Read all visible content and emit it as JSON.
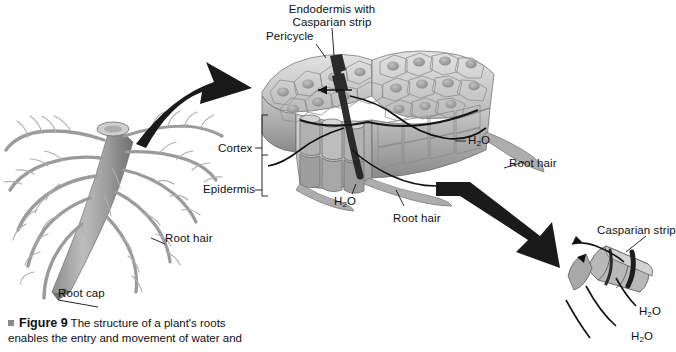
{
  "figure": {
    "number_label": "Figure 9",
    "caption_text": " The structure of a plant's roots enables the entry and movement of water and"
  },
  "labels": {
    "endodermis": "Endodermis with\nCasparian strip",
    "endodermis_line1": "Endodermis with",
    "endodermis_line2": "Casparian strip",
    "pericycle": "Pericycle",
    "cortex": "Cortex",
    "epidermis": "Epidermis",
    "root_hair_main": "Root hair",
    "root_hair_mid": "Root hair",
    "root_hair_right": "Root hair",
    "root_cap": "Root cap",
    "casparian_strip_inset": "Casparian strip",
    "water_cortex": "H",
    "water_cortex_sub": "2",
    "water_cortex_end": "O",
    "water_right": "H",
    "water_right_sub": "2",
    "water_right_end": "O",
    "water_inset_upper": "H",
    "water_inset_upper_sub": "2",
    "water_inset_upper_end": "O",
    "water_inset_lower": "H",
    "water_inset_lower_sub": "2",
    "water_inset_lower_end": "O"
  },
  "colors": {
    "background": "#ffffff",
    "ink": "#111111",
    "text": "#101010",
    "cell_light": "#d8d8d8",
    "cell_mid": "#b4b4b4",
    "cell_dark": "#8e8e8e",
    "cell_shadow": "#6e6e6e",
    "root_body": "#a9a9a9",
    "root_shade": "#7d7d7d",
    "strip_dark": "#1e1e1e",
    "arrow": "#1a1a1a",
    "caption_bullet": "#8a8a8a"
  },
  "diagram": {
    "type": "labeled-biology-illustration",
    "panels": [
      {
        "name": "whole-root",
        "description": "taproot with lateral roots and root hairs"
      },
      {
        "name": "root-cross-section",
        "description": "3D block of root tissue showing epidermis, cortex, endodermis, pericycle"
      },
      {
        "name": "casparian-detail",
        "description": "close-up of endodermal cells with Casparian strip"
      }
    ],
    "zoom_arrows": 2
  }
}
